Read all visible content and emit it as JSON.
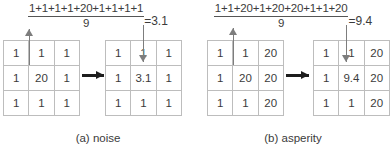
{
  "figure": {
    "panels": [
      {
        "id": "panel-a",
        "caption": "(a) noise",
        "formula": {
          "numerator": "1+1+1+1+20+1+1+1+1",
          "denominator": "9",
          "result": "=3.1"
        },
        "input_grid": {
          "rows": [
            [
              "1",
              "1",
              "1"
            ],
            [
              "1",
              "20",
              "1"
            ],
            [
              "1",
              "1",
              "1"
            ]
          ]
        },
        "output_grid": {
          "rows": [
            [
              "1",
              "1",
              "1"
            ],
            [
              "1",
              "3.1",
              "1"
            ],
            [
              "1",
              "1",
              "1"
            ]
          ]
        }
      },
      {
        "id": "panel-b",
        "caption": "(b) asperity",
        "formula": {
          "numerator": "1+1+20+1+20+20+1+1+20",
          "denominator": "9",
          "result": "=9.4"
        },
        "input_grid": {
          "rows": [
            [
              "1",
              "1",
              "20"
            ],
            [
              "1",
              "20",
              "20"
            ],
            [
              "1",
              "1",
              "20"
            ]
          ]
        },
        "output_grid": {
          "rows": [
            [
              "1",
              "1",
              "20"
            ],
            [
              "1",
              "9.4",
              "20"
            ],
            [
              "1",
              "1",
              "20"
            ]
          ]
        }
      }
    ],
    "colors": {
      "grid_border": "#bdbdbd",
      "text": "#3b3b3b",
      "vertical_arrow": "#7d7d7d",
      "horizontal_arrow": "#1d1d1d",
      "background": "#ffffff"
    }
  }
}
